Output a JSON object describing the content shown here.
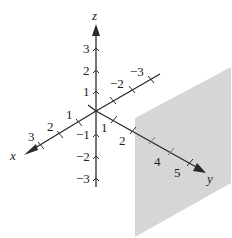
{
  "diagram": {
    "type": "3d-coordinate-system-with-plane",
    "colors": {
      "axis": "#2a2a2a",
      "plane": "#d6d6d6",
      "background": "#ffffff"
    },
    "axes": {
      "x": {
        "name": "x",
        "ticks": [
          "1",
          "2",
          "3"
        ]
      },
      "y": {
        "name": "y",
        "positive_ticks": [
          "1",
          "2",
          "4",
          "5"
        ],
        "negative_ticks": [
          "-2",
          "-3"
        ]
      },
      "z": {
        "name": "z",
        "positive_ticks": [
          "1",
          "2",
          "3"
        ],
        "negative_ticks": [
          "-1",
          "-2",
          "-3"
        ]
      }
    },
    "plane": {
      "description": "shaded vertical plane perpendicular to y-axis at y = 3"
    }
  }
}
